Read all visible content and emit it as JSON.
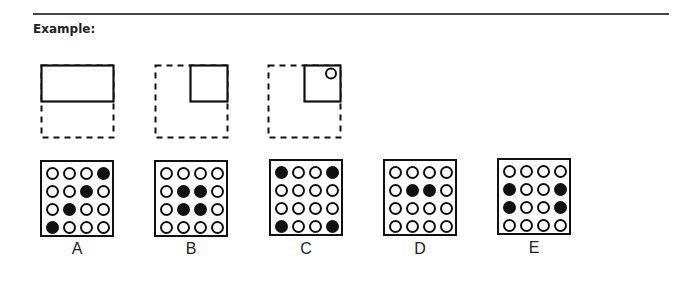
{
  "heading": "Example:",
  "sequence": [
    {
      "id": "fig1",
      "description": "solid top half rectangle over dashed square"
    },
    {
      "id": "fig2",
      "description": "solid top-right quarter square within dashed square"
    },
    {
      "id": "fig3",
      "description": "solid top-right quarter square with small circle within dashed square"
    }
  ],
  "options": [
    {
      "label": "A",
      "grid": [
        [
          0,
          0,
          0,
          1
        ],
        [
          0,
          0,
          1,
          0
        ],
        [
          0,
          1,
          0,
          0
        ],
        [
          1,
          0,
          0,
          0
        ]
      ]
    },
    {
      "label": "B",
      "grid": [
        [
          0,
          0,
          0,
          0
        ],
        [
          0,
          1,
          1,
          0
        ],
        [
          0,
          1,
          1,
          0
        ],
        [
          0,
          0,
          0,
          0
        ]
      ]
    },
    {
      "label": "C",
      "grid": [
        [
          1,
          0,
          0,
          1
        ],
        [
          0,
          0,
          0,
          0
        ],
        [
          0,
          0,
          0,
          0
        ],
        [
          1,
          0,
          0,
          1
        ]
      ]
    },
    {
      "label": "D",
      "grid": [
        [
          0,
          0,
          0,
          0
        ],
        [
          0,
          1,
          1,
          0
        ],
        [
          0,
          0,
          0,
          0
        ],
        [
          0,
          0,
          0,
          0
        ]
      ]
    },
    {
      "label": "E",
      "grid": [
        [
          0,
          0,
          0,
          0
        ],
        [
          1,
          0,
          0,
          1
        ],
        [
          1,
          0,
          0,
          1
        ],
        [
          0,
          0,
          0,
          0
        ]
      ]
    }
  ],
  "colors": {
    "ink": "#111111",
    "background": "#ffffff",
    "rule": "#444444"
  }
}
